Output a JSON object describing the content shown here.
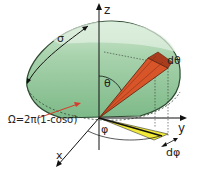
{
  "diagram": {
    "axes": {
      "x": "x",
      "y": "y",
      "z": "z"
    },
    "labels": {
      "sigma": "σ",
      "theta": "θ",
      "phi": "φ",
      "d_theta": "dθ",
      "d_phi": "dφ",
      "formula": "Ω=2π(1-cosσ)"
    },
    "colors": {
      "cap_fill": "#8fc79a",
      "cap_light": "#c6e3c8",
      "cap_edge": "#2f4a32",
      "cone": "#d8552a",
      "cone_edge": "#5a1e0c",
      "wedge": "#f2ea3a",
      "arrow_red": "#d83a2a",
      "axis": "#1a1a1a"
    }
  }
}
